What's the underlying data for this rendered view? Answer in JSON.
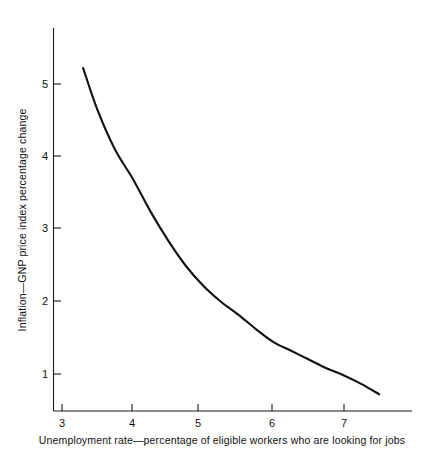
{
  "chart_data": {
    "type": "line",
    "title": "",
    "subtitle": "",
    "xlabel": "Unemployment rate—percentage of eligible workers who are looking for jobs",
    "ylabel": "Inflation—GNP price index percentage change",
    "xlim": [
      2.55,
      8.0
    ],
    "ylim": [
      0.12,
      5.75
    ],
    "xticks": [
      3,
      4,
      5,
      6,
      7
    ],
    "xtick_labels": [
      "3",
      "4",
      "5",
      "6",
      "7"
    ],
    "yticks": [
      1,
      2,
      3,
      4,
      5
    ],
    "ytick_labels": [
      "1",
      "2",
      "3",
      "4",
      "5"
    ],
    "grid": false,
    "legend": null,
    "legend_position": "none",
    "series": [
      {
        "name": "Phillips curve",
        "color": "#111111",
        "x": [
          3.3,
          3.5,
          3.75,
          4.0,
          4.25,
          4.5,
          4.75,
          5.0,
          5.25,
          5.5,
          5.75,
          6.0,
          6.25,
          6.5,
          6.75,
          7.0,
          7.25,
          7.5
        ],
        "y": [
          5.22,
          4.65,
          4.1,
          3.7,
          3.25,
          2.85,
          2.5,
          2.22,
          2.0,
          1.82,
          1.62,
          1.44,
          1.32,
          1.2,
          1.08,
          0.98,
          0.86,
          0.72
        ]
      }
    ],
    "annotations": []
  },
  "axes": {
    "x_axis_name": "unemployment-rate-axis",
    "y_axis_name": "inflation-axis"
  },
  "colors": {
    "curve": "#111111",
    "axis": "#1a1a1a",
    "background": "#ffffff",
    "text": "#111111"
  }
}
